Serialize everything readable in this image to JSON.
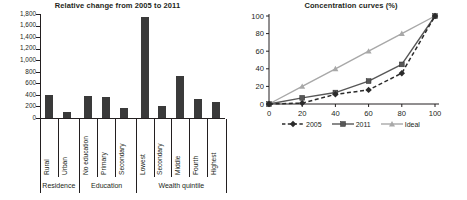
{
  "figure": {
    "background": "#ffffff",
    "ink": "#231f20"
  },
  "chart_data": [
    {
      "type": "bar",
      "title": "Relative change from 2005 to 2011",
      "xlabel": "",
      "ylabel": "",
      "ylim": [
        0,
        1800
      ],
      "yticks": [
        0,
        200,
        400,
        600,
        800,
        1000,
        1200,
        1400,
        1600,
        1800
      ],
      "ytick_labels": [
        "0",
        "200",
        "400",
        "600",
        "800",
        "1,000",
        "1,200",
        "1,400",
        "1,600",
        "1,800"
      ],
      "grid": false,
      "bar_color": "#3a3a3a",
      "categories": [
        "Rural",
        "Urban",
        "No education",
        "Primary",
        "Secondary",
        "Lowest",
        "Secondary",
        "Middle",
        "Fourth",
        "Highest"
      ],
      "values": [
        400,
        100,
        380,
        360,
        180,
        1750,
        210,
        730,
        330,
        270
      ],
      "groups": [
        {
          "label": "Residence",
          "categories": [
            "Rural",
            "Urban"
          ]
        },
        {
          "label": "Education",
          "categories": [
            "No education",
            "Primary",
            "Secondary"
          ]
        },
        {
          "label": "Wealth quintile",
          "categories": [
            "Lowest",
            "Secondary",
            "Middle",
            "Fourth",
            "Highest"
          ]
        }
      ]
    },
    {
      "type": "line",
      "title": "Concentration curves (%)",
      "xlabel": "",
      "ylabel": "",
      "xlim": [
        0,
        100
      ],
      "ylim": [
        0,
        100
      ],
      "xticks": [
        0,
        20,
        40,
        60,
        80,
        100
      ],
      "xtick_labels": [
        "0",
        "20",
        "40",
        "60",
        "80",
        "100"
      ],
      "yticks": [
        0,
        20,
        40,
        60,
        80,
        100
      ],
      "ytick_labels": [
        "0",
        "20",
        "40",
        "60",
        "80",
        "100"
      ],
      "grid": false,
      "legend_position": "bottom",
      "x": [
        0,
        20,
        40,
        60,
        80,
        100
      ],
      "series": [
        {
          "name": "2005",
          "values": [
            0,
            1,
            11,
            16,
            35,
            100
          ],
          "color": "#2b2b2b",
          "marker": "diamond",
          "dash": "dashed"
        },
        {
          "name": "2011",
          "values": [
            0,
            7,
            13,
            26,
            45,
            100
          ],
          "color": "#575757",
          "marker": "square",
          "dash": "solid"
        },
        {
          "name": "Ideal",
          "values": [
            0,
            20,
            40,
            60,
            80,
            100
          ],
          "color": "#a8a8a8",
          "marker": "triangle",
          "dash": "solid"
        }
      ]
    }
  ]
}
